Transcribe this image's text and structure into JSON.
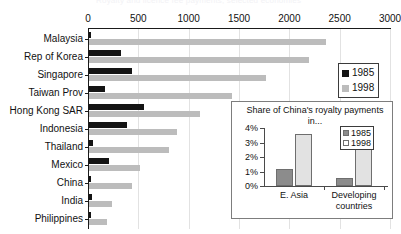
{
  "cut_title": "Royalty and licence fee payments, selected economies",
  "chart_data": [
    {
      "id": "main",
      "type": "bar",
      "orientation": "horizontal",
      "title": "",
      "xlabel": "",
      "ylabel": "",
      "xlim": [
        0,
        3000
      ],
      "xticks": [
        0,
        500,
        1000,
        1500,
        2000,
        2500,
        3000
      ],
      "xtick_labels": [
        "0",
        "500",
        "1000",
        "1500",
        "2000",
        "2500",
        "3000"
      ],
      "grid": true,
      "legend_position": "right",
      "categories": [
        "Malaysia",
        "Rep of Korea",
        "Singapore",
        "Taiwan Prov",
        "Hong Kong SAR",
        "Indonesia",
        "Thailand",
        "Mexico",
        "China",
        "India",
        "Philippines"
      ],
      "series": [
        {
          "name": "1985",
          "color": "#141414",
          "values": [
            15,
            320,
            430,
            160,
            550,
            380,
            40,
            200,
            10,
            25,
            20
          ]
        },
        {
          "name": "1998",
          "color": "#bcbcbc",
          "values": [
            2350,
            2190,
            1760,
            1420,
            1100,
            870,
            790,
            510,
            430,
            230,
            175
          ]
        }
      ]
    },
    {
      "id": "inset",
      "type": "bar",
      "orientation": "vertical",
      "title": "Share of China's royalty payments in...",
      "xlabel": "",
      "ylabel": "",
      "ylim": [
        0,
        4
      ],
      "yticks": [
        0,
        1,
        2,
        3,
        4
      ],
      "ytick_labels": [
        "0%",
        "1%",
        "2%",
        "3%",
        "4%"
      ],
      "grid": false,
      "legend_position": "top-right",
      "categories": [
        "E. Asia",
        "Developing countries"
      ],
      "series": [
        {
          "name": "1985",
          "color": "#8c8c8c",
          "values": [
            1.2,
            0.55
          ]
        },
        {
          "name": "1998",
          "color": "#e2e2e2",
          "values": [
            3.6,
            2.85
          ]
        }
      ]
    }
  ],
  "main_legend": {
    "items": [
      {
        "label": "1985",
        "color": "#141414"
      },
      {
        "label": "1998",
        "color": "#bcbcbc"
      }
    ]
  },
  "inset_legend": {
    "items": [
      {
        "label": "1985",
        "color": "#8c8c8c"
      },
      {
        "label": "1998",
        "color": "#ffffff"
      }
    ]
  }
}
